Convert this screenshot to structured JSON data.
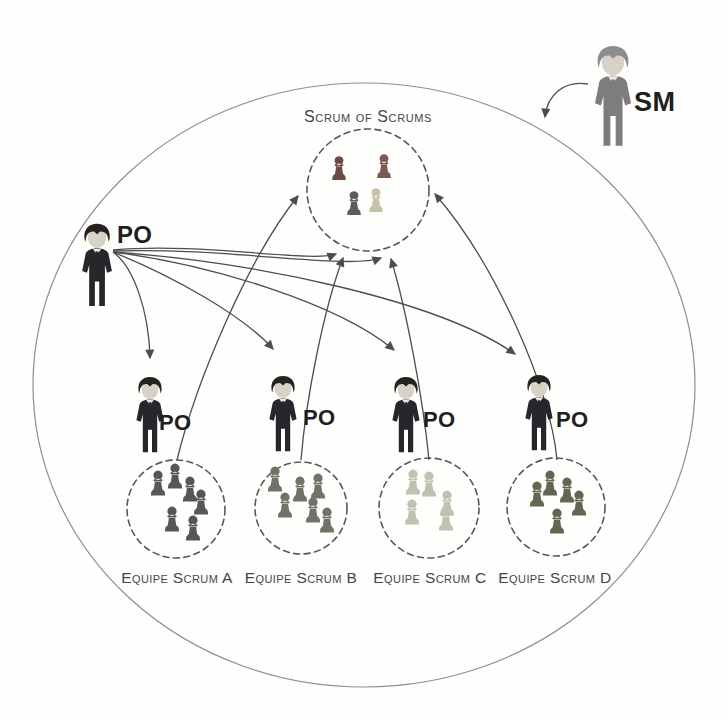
{
  "diagram": {
    "sos": {
      "label": "Scrum of Scrums",
      "pawn_colors": [
        "#6f4a44",
        "#7c5a50",
        "#5b5d60",
        "#c6c2a8"
      ]
    },
    "sm": {
      "label": "SM"
    },
    "main_po": {
      "label": "PO"
    },
    "pos": [
      {
        "label": "PO"
      },
      {
        "label": "PO"
      },
      {
        "label": "PO"
      },
      {
        "label": "PO"
      }
    ],
    "teams": [
      {
        "label": "Equipe Scrum A",
        "color": "#55565a"
      },
      {
        "label": "Equipe Scrum B",
        "color": "#6e7566"
      },
      {
        "label": "Equipe Scrum C",
        "color": "#c2c0ae"
      },
      {
        "label": "Equipe Scrum D",
        "color": "#636650"
      }
    ],
    "colors": {
      "arrow": "#4d4d4f",
      "boundary": "#8f8f8f",
      "dashed": "#58585a",
      "po_suit": "#26262b",
      "po_hair": "#26221f",
      "face": "#d8d1c5",
      "shirt": "#edeae2",
      "sm_suit": "#7d7d7f",
      "sm_hair": "#8e8e90",
      "label_dark": "#1f1f22",
      "label_gray": "#454547"
    }
  }
}
